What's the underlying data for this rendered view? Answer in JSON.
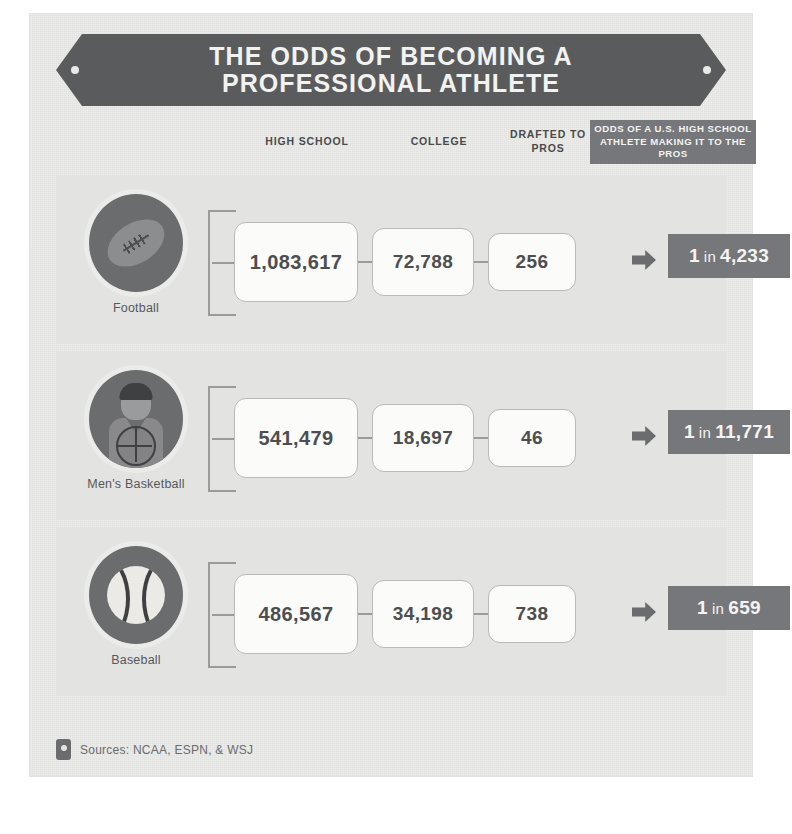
{
  "title": "THE ODDS OF BECOMING A PROFESSIONAL ATHLETE",
  "title_line1": "THE ODDS OF BECOMING A",
  "title_line2": "PROFESSIONAL ATHLETE",
  "columns": {
    "high_school": "HIGH SCHOOL",
    "college": "COLLEGE",
    "drafted": "DRAFTED TO PROS",
    "odds": "ODDS OF A U.S. HIGH SCHOOL ATHLETE MAKING IT TO THE PROS"
  },
  "rows": [
    {
      "sport": "Football",
      "icon": "football-icon",
      "high_school": "1,083,617",
      "college": "72,788",
      "drafted": "256",
      "odds_prefix": "1",
      "odds_join": "in",
      "odds_value": "4,233",
      "odds_full": "1 in 4,233"
    },
    {
      "sport": "Men's Basketball",
      "icon": "basketball-player-icon",
      "high_school": "541,479",
      "college": "18,697",
      "drafted": "46",
      "odds_prefix": "1",
      "odds_join": "in",
      "odds_value": "11,771",
      "odds_full": "1 in 11,771"
    },
    {
      "sport": "Baseball",
      "icon": "baseball-icon",
      "high_school": "486,567",
      "college": "34,198",
      "drafted": "738",
      "odds_prefix": "1",
      "odds_join": "in",
      "odds_value": "659",
      "odds_full": "1 in 659"
    }
  ],
  "footer": {
    "sources": "Sources: NCAA, ESPN, & WSJ",
    "icon": "document-icon"
  },
  "colors": {
    "banner": "#5a5b5d",
    "paper": "#ececea",
    "row_panel": "#e3e3e1",
    "odds_pill": "#76777a",
    "box_fill": "#fbfbfa",
    "box_border": "#b9bab9",
    "text_dark": "#4d4e50",
    "text_muted": "#6a6b6d",
    "icon_disc": "#6b6c6e"
  },
  "chart_data": {
    "type": "table",
    "title": "THE ODDS OF BECOMING A PROFESSIONAL ATHLETE",
    "columns": [
      "Sport",
      "HIGH SCHOOL",
      "COLLEGE",
      "DRAFTED TO PROS",
      "ODDS OF A U.S. HIGH SCHOOL ATHLETE MAKING IT TO THE PROS"
    ],
    "rows": [
      [
        "Football",
        1083617,
        72788,
        256,
        "1 in 4,233"
      ],
      [
        "Men's Basketball",
        541479,
        18697,
        46,
        "1 in 11,771"
      ],
      [
        "Baseball",
        486567,
        34198,
        738,
        "1 in 659"
      ]
    ],
    "notes": "Sources: NCAA, ESPN, & WSJ"
  }
}
